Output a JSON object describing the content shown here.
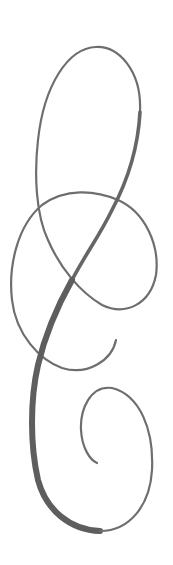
{
  "image": {
    "description": "Decorative calligraphic swirl flourish",
    "stroke_color": "#6e6e6e",
    "thick_stroke_color": "#5e5e5e",
    "background": "#ffffff"
  }
}
